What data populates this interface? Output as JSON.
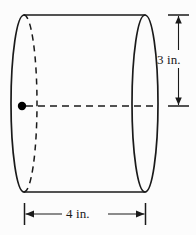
{
  "figure": {
    "kind": "cylinder-diagram",
    "background_color": "#fcfcfc",
    "stroke_color": "#1a1a1a",
    "dot_color": "#000000"
  },
  "dimensions": {
    "height": {
      "value": "3",
      "unit": "in.",
      "label": "3 in.",
      "orientation": "vertical",
      "position": "right"
    },
    "width": {
      "value": "4",
      "unit": "in.",
      "label": "4 in.",
      "orientation": "horizontal",
      "position": "bottom"
    }
  },
  "geometry": {
    "left_ellipse": {
      "cx": 24,
      "cy": 103.5,
      "rx": 13,
      "ry": 88.5
    },
    "right_ellipse": {
      "cx": 145,
      "cy": 103.5,
      "rx": 13,
      "ry": 88.5
    },
    "top_edge": {
      "x1": 24,
      "y1": 15,
      "x2": 145,
      "y2": 15
    },
    "bottom_edge": {
      "x1": 24,
      "y1": 192,
      "x2": 145,
      "y2": 192
    },
    "axis_line": {
      "x1": 22,
      "y1": 106,
      "x2": 158,
      "y2": 106
    },
    "marked_point": {
      "cx": 22,
      "cy": 106,
      "r": 4
    },
    "height_dim_line": {
      "x": 178,
      "y1": 15,
      "y2": 106
    },
    "width_dim_line": {
      "y": 214,
      "x1": 24,
      "x2": 145
    }
  }
}
